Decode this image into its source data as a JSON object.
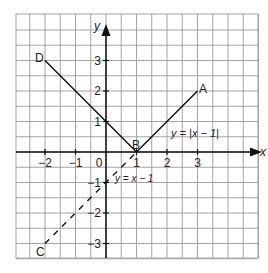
{
  "diagram": {
    "axes": {
      "x_label": "x",
      "y_label": "y",
      "x_ticks": [
        {
          "value": -2,
          "label": "−2"
        },
        {
          "value": -1,
          "label": "−1"
        },
        {
          "value": 0,
          "label": "0"
        },
        {
          "value": 1,
          "label": "1"
        },
        {
          "value": 2,
          "label": "2"
        },
        {
          "value": 3,
          "label": "3"
        }
      ],
      "y_ticks": [
        {
          "value": 3,
          "label": "3"
        },
        {
          "value": 2,
          "label": "2"
        },
        {
          "value": 1,
          "label": "1"
        },
        {
          "value": -1,
          "label": "−1"
        },
        {
          "value": -2,
          "label": "−2"
        },
        {
          "value": -3,
          "label": "−3"
        }
      ]
    },
    "points": [
      {
        "name": "A",
        "x": 3,
        "y": 2
      },
      {
        "name": "B",
        "x": 1,
        "y": 0
      },
      {
        "name": "C",
        "x": -2,
        "y": -3
      },
      {
        "name": "D",
        "x": -2,
        "y": 3
      }
    ],
    "lines": [
      {
        "name": "abs-graph",
        "label": "y = |x − 1|",
        "style": "solid",
        "path": [
          "D",
          "B",
          "A"
        ]
      },
      {
        "name": "linear-graph",
        "label": "y = x − 1",
        "style": "dashed",
        "path": [
          "C",
          "B"
        ]
      }
    ],
    "colors": {
      "grid": "#9a9a9a",
      "axis": "#111111",
      "line": "#111111",
      "text": "#222222"
    }
  }
}
